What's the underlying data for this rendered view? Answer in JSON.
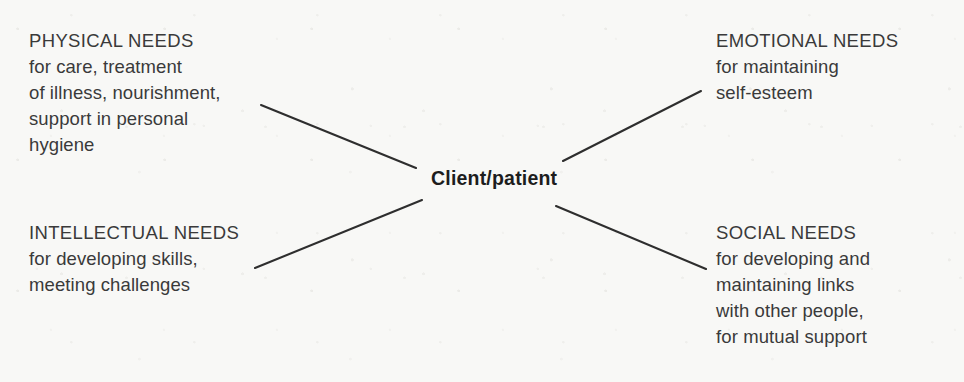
{
  "diagram": {
    "type": "radial-concept-map",
    "center": {
      "label": "Client/patient"
    },
    "branches": [
      {
        "id": "physical",
        "position": "top-left",
        "heading": "PHYSICAL NEEDS",
        "lines": [
          "PHYSICAL NEEDS",
          "for care, treatment",
          "of illness, nourishment,",
          "support in personal",
          "hygiene"
        ]
      },
      {
        "id": "emotional",
        "position": "top-right",
        "heading": "EMOTIONAL NEEDS",
        "lines": [
          "EMOTIONAL NEEDS",
          "for maintaining",
          "self-esteem"
        ]
      },
      {
        "id": "intellectual",
        "position": "bottom-left",
        "heading": "INTELLECTUAL NEEDS",
        "lines": [
          "INTELLECTUAL NEEDS",
          "for developing skills,",
          "meeting challenges"
        ]
      },
      {
        "id": "social",
        "position": "bottom-right",
        "heading": "SOCIAL NEEDS",
        "lines": [
          "SOCIAL NEEDS",
          "for developing and",
          "maintaining links",
          "with other people,",
          "for mutual support"
        ]
      }
    ],
    "connectors": [
      {
        "id": "connector-physical",
        "from": [
          261,
          105
        ],
        "to": [
          416,
          168
        ]
      },
      {
        "id": "connector-emotional",
        "from": [
          563,
          161
        ],
        "to": [
          701,
          91
        ]
      },
      {
        "id": "connector-intellectual",
        "from": [
          255,
          268
        ],
        "to": [
          422,
          200
        ]
      },
      {
        "id": "connector-social",
        "from": [
          556,
          206
        ],
        "to": [
          706,
          269
        ]
      }
    ],
    "colors": {
      "background": "#f8f8f6",
      "text": "#3a3a3a",
      "center_text": "#1d1d1d",
      "connector": "#2e2e2e"
    }
  }
}
